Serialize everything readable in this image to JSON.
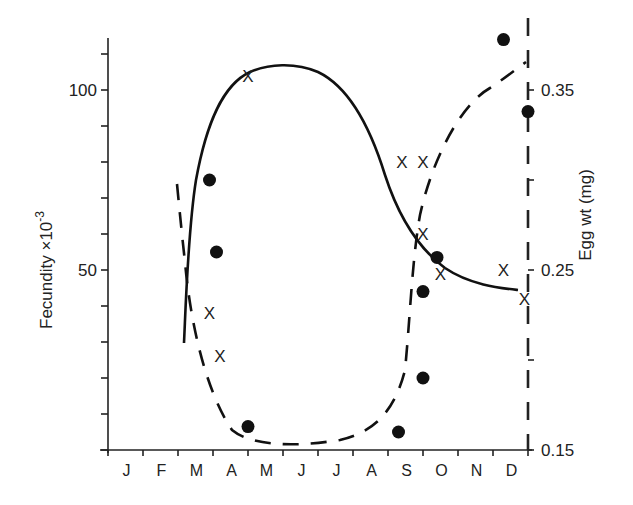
{
  "chart_data": {
    "type": "line",
    "title": "",
    "xlabel": "",
    "ylabel": "Fecundity ×10⁻³",
    "ylabel_main": "Fecundity ×10",
    "ylabel_exp": "-3",
    "y2label": "Egg wt (mg)",
    "categories": [
      "J",
      "F",
      "M",
      "A",
      "M",
      "J",
      "J",
      "A",
      "S",
      "O",
      "N",
      "D"
    ],
    "ylim": [
      0,
      115
    ],
    "y2lim": [
      0.15,
      0.39
    ],
    "yticks": [
      {
        "value": 100,
        "label": "100"
      },
      {
        "value": 50,
        "label": "50"
      }
    ],
    "y2ticks": [
      {
        "value": 0.35,
        "label": "0.35"
      },
      {
        "value": 0.25,
        "label": "0.25"
      },
      {
        "value": 0.15,
        "label": "0.15"
      }
    ],
    "grid": false,
    "series": [
      {
        "name": "Fecundity",
        "axis": "left",
        "marker": "x",
        "line": "solid",
        "points": [
          {
            "month": 2.9,
            "value": 38
          },
          {
            "month": 3.2,
            "value": 26
          },
          {
            "month": 4.0,
            "value": 104
          },
          {
            "month": 8.4,
            "value": 80
          },
          {
            "month": 9.0,
            "value": 80
          },
          {
            "month": 9.0,
            "value": 60
          },
          {
            "month": 9.5,
            "value": 49
          },
          {
            "month": 11.3,
            "value": 50
          },
          {
            "month": 11.9,
            "value": 42
          }
        ]
      },
      {
        "name": "Egg weight",
        "axis": "right",
        "marker": "dot",
        "line": "dashed",
        "points": [
          {
            "month": 2.9,
            "value": 0.3
          },
          {
            "month": 3.1,
            "value": 0.26
          },
          {
            "month": 4.0,
            "value": 0.163
          },
          {
            "month": 8.3,
            "value": 0.16
          },
          {
            "month": 9.0,
            "value": 0.19
          },
          {
            "month": 9.0,
            "value": 0.238
          },
          {
            "month": 9.4,
            "value": 0.257
          },
          {
            "month": 11.3,
            "value": 0.378
          },
          {
            "month": 12.0,
            "value": 0.338
          }
        ]
      }
    ]
  }
}
